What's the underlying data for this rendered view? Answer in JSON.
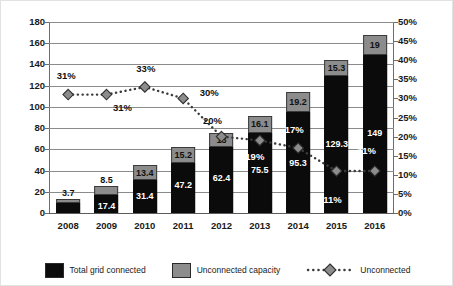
{
  "chart_data": {
    "type": "bar",
    "title": "",
    "subtitle": "",
    "xlabel": "",
    "ylabel": "",
    "y2label": "",
    "categories": [
      "2008",
      "2009",
      "2010",
      "2011",
      "2012",
      "2013",
      "2014",
      "2015",
      "2016"
    ],
    "ylim": [
      0,
      180
    ],
    "yticks": [
      "0",
      "20",
      "40",
      "60",
      "80",
      "100",
      "120",
      "140",
      "160",
      "180"
    ],
    "ytick_values": [
      0,
      20,
      40,
      60,
      80,
      100,
      120,
      140,
      160,
      180
    ],
    "y2lim": [
      0,
      50
    ],
    "y2ticks": [
      "0%",
      "5%",
      "10%",
      "15%",
      "20%",
      "25%",
      "30%",
      "35%",
      "40%",
      "45%",
      "50%"
    ],
    "y2tick_values": [
      0,
      5,
      10,
      15,
      20,
      25,
      30,
      35,
      40,
      45,
      50
    ],
    "grid": true,
    "legend_position": "bottom",
    "stacked": true,
    "series": [
      {
        "name": "Total grid connected",
        "type": "bar",
        "color": "#0b0b0b",
        "axis": "left",
        "values": [
          9.5,
          17.4,
          31.4,
          47.2,
          62.4,
          75.5,
          95.3,
          129.3,
          149
        ],
        "labels": [
          "",
          "17.4",
          "31.4",
          "47.2",
          "62.4",
          "75.5",
          "95.3",
          "129.3",
          "149"
        ]
      },
      {
        "name": "Unconnected capacity",
        "type": "bar",
        "color": "#8c8c8c",
        "axis": "left",
        "values": [
          3.7,
          8.5,
          13.4,
          15.2,
          13,
          16.1,
          19.2,
          15.3,
          19
        ],
        "labels": [
          "3.7",
          "8.5",
          "13.4",
          "15.2",
          "13",
          "16.1",
          "19.2",
          "15.3",
          "19"
        ]
      },
      {
        "name": "Unconnected",
        "type": "line",
        "style": "dotted",
        "marker": "diamond",
        "marker_color": "#8c8c8c",
        "line_color": "#3c3c3c",
        "axis": "right",
        "values": [
          31,
          31,
          33,
          30,
          20,
          19,
          17,
          11,
          11
        ],
        "labels": [
          "31%",
          "31%",
          "33%",
          "30%",
          "20%",
          "19%",
          "17%",
          "11%",
          "11%"
        ]
      }
    ],
    "annotations": [
      {
        "text": "31%",
        "x_index": 0,
        "value": 31,
        "position": "above"
      },
      {
        "text": "31%",
        "x_index": 1,
        "value": 31,
        "position": "below-right"
      },
      {
        "text": "33%",
        "x_index": 2,
        "value": 33,
        "position": "above"
      },
      {
        "text": "30%",
        "x_index": 3,
        "value": 30,
        "position": "above-right"
      },
      {
        "text": "20%",
        "x_index": 4,
        "value": 20,
        "position": "above-left"
      },
      {
        "text": "19%",
        "x_index": 5,
        "value": 19,
        "position": "below"
      },
      {
        "text": "17%",
        "x_index": 6,
        "value": 17,
        "position": "above"
      },
      {
        "text": "11%",
        "x_index": 7,
        "value": 11,
        "position": "below"
      },
      {
        "text": "11%",
        "x_index": 8,
        "value": 11,
        "position": "above"
      }
    ]
  },
  "legend": {
    "items": [
      {
        "label": "Total grid connected",
        "swatch": "black"
      },
      {
        "label": "Unconnected capacity",
        "swatch": "grey"
      },
      {
        "label": "Unconnected",
        "swatch": "dotted-diamond"
      }
    ]
  },
  "colors": {
    "black_bar": "#0b0b0b",
    "grey_bar": "#8c8c8c",
    "gridline": "#8a8a8a",
    "axis": "#6d6d6d",
    "text": "#1a1a1a",
    "label_on_black": "#ffffff"
  }
}
